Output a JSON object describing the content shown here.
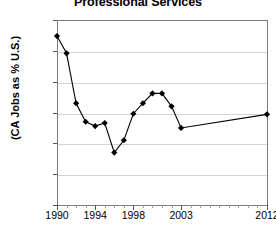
{
  "chart_data": {
    "type": "line",
    "title": "Professional Services",
    "xlabel": "",
    "ylabel": "(CA Jobs as % U.S.)",
    "ylim": [
      13.0,
      16.0
    ],
    "xlim": [
      1990,
      2012
    ],
    "ytick_labels": [
      "16.0%",
      "15.5%",
      "15.0%",
      "14.5%",
      "14.0%",
      "13.5%",
      "13.0%"
    ],
    "ytick_values": [
      16.0,
      15.5,
      15.0,
      14.5,
      14.0,
      13.5,
      13.0
    ],
    "xtick_labels": [
      "1990",
      "1994",
      "1998",
      "2003",
      "2012"
    ],
    "xtick_values": [
      1990,
      1994,
      1998,
      2003,
      2012
    ],
    "grid": true,
    "legend": "none",
    "marker": "diamond",
    "x": [
      1990,
      1991,
      1992,
      1993,
      1994,
      1995,
      1996,
      1997,
      1998,
      1999,
      2000,
      2001,
      2002,
      2003,
      2012
    ],
    "values": [
      15.74,
      15.46,
      14.65,
      14.35,
      14.28,
      14.33,
      13.85,
      14.05,
      14.48,
      14.65,
      14.81,
      14.81,
      14.6,
      14.25,
      14.47
    ],
    "series": [
      {
        "name": "CA Jobs as % U.S.",
        "values": [
          15.74,
          15.46,
          14.65,
          14.35,
          14.28,
          14.33,
          13.85,
          14.05,
          14.48,
          14.65,
          14.81,
          14.81,
          14.6,
          14.25,
          14.47
        ]
      }
    ],
    "colors": {
      "line": "#000000",
      "marker": "#000000",
      "grid": "#d4d4d4",
      "axis": "#7b7b7b",
      "background": "#ffffff"
    }
  }
}
